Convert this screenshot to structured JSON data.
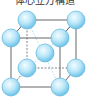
{
  "title": "体心立方構造",
  "diagram": {
    "type": "crystal-lattice",
    "structure": "body-centered cubic",
    "atom_color": "#a9def5",
    "atom_stroke": "#4aa8d6",
    "edge_color": "#555555",
    "atoms": [
      {
        "id": "back-top-left",
        "x": 27,
        "y": 20
      },
      {
        "id": "back-top-right",
        "x": 76,
        "y": 20
      },
      {
        "id": "back-bottom-left",
        "x": 27,
        "y": 68
      },
      {
        "id": "back-bottom-right",
        "x": 76,
        "y": 68
      },
      {
        "id": "center",
        "x": 45,
        "y": 53
      },
      {
        "id": "front-top-left",
        "x": 11,
        "y": 38
      },
      {
        "id": "front-top-right",
        "x": 60,
        "y": 38
      },
      {
        "id": "front-bottom-left",
        "x": 11,
        "y": 87
      },
      {
        "id": "front-bottom-right",
        "x": 60,
        "y": 87
      }
    ]
  }
}
